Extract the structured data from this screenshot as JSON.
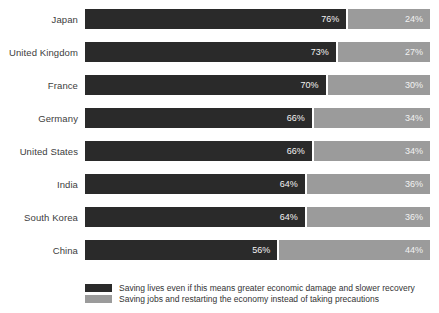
{
  "chart_data": {
    "type": "bar",
    "orientation": "horizontal",
    "stacked": true,
    "categories": [
      "Japan",
      "United Kingdom",
      "France",
      "Germany",
      "United States",
      "India",
      "South Korea",
      "China"
    ],
    "series": [
      {
        "name": "Saving lives even if this means greater economic damage and slower recovery",
        "values": [
          76,
          73,
          70,
          66,
          66,
          64,
          64,
          56
        ],
        "color": "#2a2a2a"
      },
      {
        "name": "Saving jobs and restarting the economy instead of taking precautions",
        "values": [
          24,
          27,
          30,
          34,
          34,
          36,
          36,
          44
        ],
        "color": "#9b9b9b"
      }
    ],
    "value_suffix": "%",
    "xlim": [
      0,
      100
    ],
    "title": "",
    "xlabel": "",
    "ylabel": "",
    "grid": false,
    "legend_position": "bottom",
    "value_label_color": "#f2f2f2",
    "category_label_color": "#3d3d3d"
  },
  "legend": {
    "items": [
      {
        "label": "Saving lives even if this means greater economic damage and slower recovery",
        "color": "#2a2a2a"
      },
      {
        "label": "Saving jobs and restarting the economy instead of taking precautions",
        "color": "#9b9b9b"
      }
    ]
  }
}
